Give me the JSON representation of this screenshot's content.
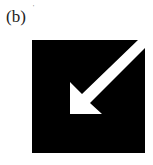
{
  "figure": {
    "panel_label": "(b)",
    "mark": "'",
    "icon": {
      "name": "arrow-down-left-icon",
      "background": "#000000",
      "foreground": "#ffffff"
    }
  }
}
